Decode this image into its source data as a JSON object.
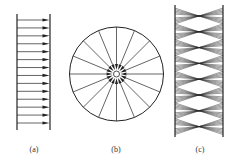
{
  "figure": {
    "width": 233,
    "height": 163,
    "stroke_color": "#222222",
    "panels": [
      {
        "id": "a",
        "label": "(a)",
        "description": "parallel arrows between two vertical walls",
        "left_wall_x": 17,
        "right_wall_x": 50,
        "wall_top": 14,
        "wall_bottom": 130,
        "arrow_count": 14,
        "arrow_first_y": 20,
        "arrow_last_y": 123,
        "label_x": 34,
        "label_y": 152
      },
      {
        "id": "b",
        "label": "(b)",
        "description": "circle with radial spokes converging to center",
        "cx": 116.5,
        "cy": 74,
        "radius": 47,
        "spoke_count": 16,
        "inner_radius": 3,
        "wedge_outer_radius": 10,
        "label_x": 116,
        "label_y": 152
      },
      {
        "id": "c",
        "label": "(c)",
        "description": "crossing fan lines between two vertical walls",
        "left_wall_x": 175,
        "right_wall_x": 223,
        "wall_top": 5,
        "wall_bottom": 137,
        "waist_count": 8,
        "waist_first_y": 16,
        "waist_spacing": 15.8,
        "fan_lines": 5,
        "label_x": 200,
        "label_y": 152
      }
    ]
  }
}
